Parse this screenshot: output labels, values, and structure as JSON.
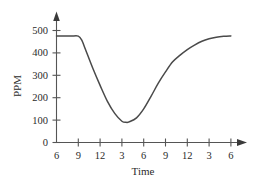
{
  "chart_data": {
    "type": "line",
    "title": "",
    "xlabel": "Time",
    "ylabel": "PPM",
    "xtick_labels": [
      "6",
      "9",
      "12",
      "3",
      "6",
      "9",
      "12",
      "3",
      "6"
    ],
    "ytick_labels": [
      "0",
      "100",
      "200",
      "300",
      "400",
      "500"
    ],
    "ytick_values": [
      0,
      100,
      200,
      300,
      400,
      500
    ],
    "ylim": [
      0,
      540
    ],
    "xlim": [
      0,
      9.6
    ],
    "grid": false,
    "legend": null,
    "annotations": [],
    "series": [
      {
        "name": "PPM over time",
        "x": [
          6,
          7,
          8,
          9,
          9.5,
          10,
          11,
          12,
          1,
          2,
          3,
          3.5,
          4,
          5,
          6,
          7,
          8,
          9,
          10,
          11,
          12,
          1,
          2,
          3,
          4,
          5,
          6
        ],
        "x_index": [
          0,
          0.33,
          0.67,
          1.0,
          1.17,
          1.33,
          1.67,
          2.0,
          2.33,
          2.67,
          3.0,
          3.2,
          3.33,
          3.67,
          4.0,
          4.33,
          4.67,
          5.0,
          5.33,
          5.67,
          6.0,
          6.33,
          6.67,
          7.0,
          7.33,
          7.67,
          8.0
        ],
        "values": [
          475,
          475,
          475,
          475,
          455,
          415,
          330,
          255,
          185,
          130,
          95,
          90,
          92,
          110,
          150,
          205,
          265,
          315,
          360,
          390,
          415,
          435,
          452,
          463,
          470,
          474,
          476
        ]
      }
    ],
    "curve_description": "Flat at about 475 PPM from first tick (6) to second tick (9), then a steep decline to a minimum of roughly 90 PPM near the fourth tick (3), followed by a smooth rise that flattens back to about 475 PPM at the last tick (6)."
  },
  "colors": {
    "curve": "#4a4a4a",
    "axis": "#555555",
    "text": "#2b2b2b",
    "background": "#ffffff"
  }
}
